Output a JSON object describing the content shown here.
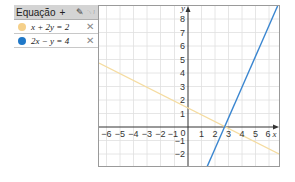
{
  "algebra_panel": {
    "header_label": "Equação",
    "add_label": "+",
    "tools_icons": [
      "pencil-icon",
      "pointer-icon"
    ],
    "equations": [
      {
        "label": "x + 2y = 2",
        "color": "#f5d08a",
        "delete": "✕"
      },
      {
        "label": "2x − y = 4",
        "color": "#1f78c8",
        "delete": "✕"
      }
    ]
  },
  "graph": {
    "x_label": "x",
    "y_label": "y",
    "x_ticks": [
      "−6",
      "−5",
      "−4",
      "−3",
      "−2",
      "−1",
      "0",
      "1",
      "2",
      "3",
      "4",
      "5",
      "6"
    ],
    "y_ticks": [
      "8",
      "7",
      "6",
      "5",
      "4",
      "3",
      "2",
      "1",
      "−1",
      "−2"
    ],
    "line1_color": "#f5dca0",
    "line2_color": "#3a86d0"
  }
}
